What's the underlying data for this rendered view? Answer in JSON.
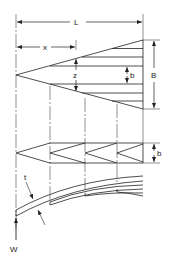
{
  "diagram": {
    "labels": {
      "length": "L",
      "distance": "x",
      "width_at_x": "z",
      "leaf_width": "b",
      "base_width": "B",
      "thickness": "t",
      "load": "W"
    },
    "views": [
      {
        "name": "plan-view-triangle",
        "description": "Triangular plate divided into strips of width b"
      },
      {
        "name": "rearranged-strips",
        "description": "Strips rearranged into leaves of width b"
      },
      {
        "name": "side-view-leaf-stack",
        "description": "Curved stacked leaves with thickness t, end load W"
      }
    ],
    "colors": {
      "line": "#222222",
      "background": "#ffffff"
    }
  }
}
